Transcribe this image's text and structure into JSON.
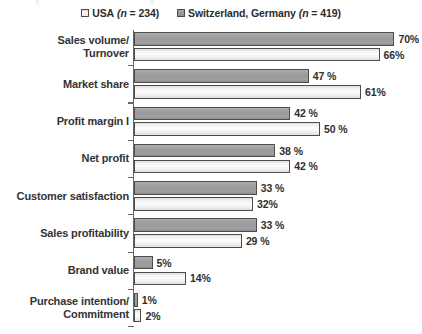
{
  "legend": {
    "series": [
      {
        "key": "usa",
        "label": "USA",
        "n_text": "(n = 234)",
        "swatch": "light-square-swatch",
        "color": "#f2f2f2"
      },
      {
        "key": "che_deu",
        "label": "Switzerland, Germany",
        "n_text": "(n = 419)",
        "swatch": "gray-square-swatch",
        "color": "#9a9a9a"
      }
    ]
  },
  "chart_data": {
    "type": "bar",
    "orientation": "horizontal",
    "title": "",
    "subtitle": "",
    "xlabel": "",
    "ylabel": "",
    "xlim": [
      0,
      78
    ],
    "grid": false,
    "legend_position": "top-center",
    "value_suffix": "%",
    "categories": [
      "Sales volume/ Turnover",
      "Market share",
      "Profit margin I",
      "Net profit",
      "Customer satisfaction",
      "Sales profitability",
      "Brand value",
      "Purchase intention/ Commitment"
    ],
    "category_lines": [
      [
        "Sales volume/",
        "Turnover"
      ],
      [
        "Market share",
        ""
      ],
      [
        "Profit margin I",
        ""
      ],
      [
        "Net profit",
        ""
      ],
      [
        "Customer satisfaction",
        ""
      ],
      [
        "Sales profitability",
        ""
      ],
      [
        "Brand value",
        ""
      ],
      [
        "Purchase intention/",
        "Commitment"
      ]
    ],
    "series": [
      {
        "name": "Switzerland, Germany (n = 419)",
        "key": "che_deu",
        "values": [
          70,
          47,
          42,
          38,
          33,
          33,
          5,
          1
        ],
        "labels": [
          "70%",
          "47 %",
          "42 %",
          "38 %",
          "33 %",
          "33 %",
          "5%",
          "1%"
        ]
      },
      {
        "name": "USA (n = 234)",
        "key": "usa",
        "values": [
          66,
          61,
          50,
          42,
          32,
          29,
          14,
          2
        ],
        "labels": [
          "66%",
          "61%",
          "50 %",
          "42 %",
          "32%",
          "29 %",
          "14%",
          "2%"
        ]
      }
    ]
  }
}
